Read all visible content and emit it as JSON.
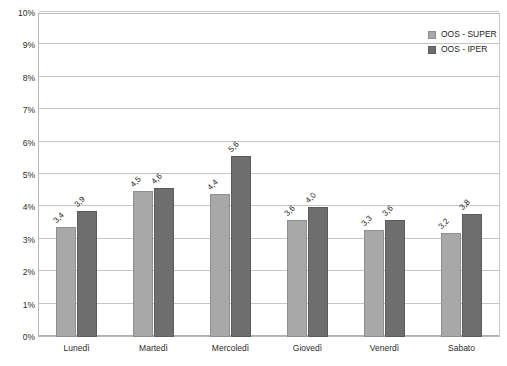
{
  "chart_data": {
    "type": "bar",
    "title": "",
    "subtitle": "",
    "xlabel": "",
    "ylabel": "",
    "categories": [
      "Lunedì",
      "Martedì",
      "Mercoledì",
      "Giovedì",
      "Venerdì",
      "Sabato"
    ],
    "series": [
      {
        "name": "OOS - SUPER",
        "color": "#a8a8a8",
        "values": [
          3.4,
          4.5,
          4.4,
          3.6,
          3.3,
          3.2
        ],
        "labels": [
          "3,4",
          "4,5",
          "4,4",
          "3,6",
          "3,3",
          "3,2"
        ]
      },
      {
        "name": "OOS - IPER",
        "color": "#6e6e6e",
        "values": [
          3.9,
          4.6,
          5.6,
          4.0,
          3.6,
          3.8
        ],
        "labels": [
          "3,9",
          "4,6",
          "5,6",
          "4,0",
          "3,6",
          "3,8"
        ]
      }
    ],
    "ylim": [
      0,
      10
    ],
    "ytick_values": [
      0,
      1,
      2,
      3,
      4,
      5,
      6,
      7,
      8,
      9,
      10
    ],
    "ytick_labels": [
      "0%",
      "1%",
      "2%",
      "3%",
      "4%",
      "5%",
      "6%",
      "7%",
      "8%",
      "9%",
      "10%"
    ],
    "grid": true,
    "grid_color": "#c6c6c6",
    "legend_position": "top-right",
    "value_label_rotation": -45
  },
  "legend": {
    "entries": [
      {
        "label": "OOS - SUPER",
        "swatch": "legend-swatch-super"
      },
      {
        "label": "OOS - IPER",
        "swatch": "legend-swatch-iper"
      }
    ]
  }
}
